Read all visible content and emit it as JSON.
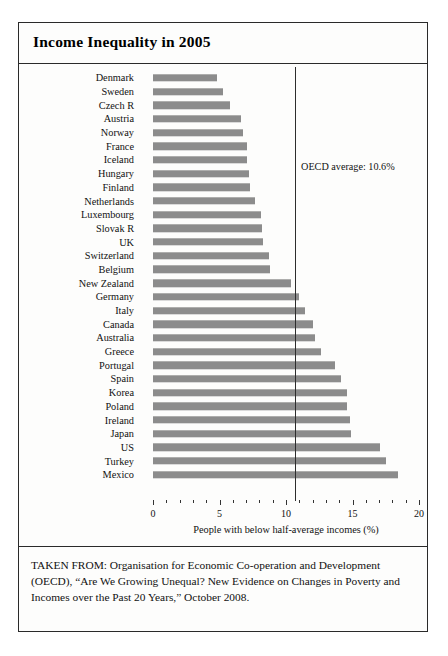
{
  "figure": {
    "title": "Income Inequality in 2005",
    "source_note": "TAKEN FROM: Organisation for Economic Co-operation and Development (OECD), “Are We Growing Unequal? New Evidence on Changes in Poverty and Incomes over the Past 20 Years,” October 2008."
  },
  "annotation": {
    "oecd_average_label": "OECD average: 10.6%",
    "oecd_average_value": 10.6
  },
  "chart_data": {
    "type": "bar",
    "orientation": "horizontal",
    "title": "Income Inequality in 2005",
    "xlabel": "People with below half-average incomes (%)",
    "ylabel": "",
    "xlim": [
      0,
      20
    ],
    "xticks": [
      0,
      5,
      10,
      15,
      20
    ],
    "xtick_labels": [
      "0",
      "5",
      "10",
      "15",
      "20"
    ],
    "minor_tick_step": 1,
    "grid": false,
    "legend": false,
    "bar_color": "#8c8c8c",
    "categories": [
      "Denmark",
      "Sweden",
      "Czech R",
      "Austria",
      "Norway",
      "France",
      "Iceland",
      "Hungary",
      "Finland",
      "Netherlands",
      "Luxembourg",
      "Slovak R",
      "UK",
      "Switzerland",
      "Belgium",
      "New Zealand",
      "Germany",
      "Italy",
      "Canada",
      "Australia",
      "Greece",
      "Portugal",
      "Spain",
      "Korea",
      "Poland",
      "Ireland",
      "Japan",
      "US",
      "Turkey",
      "Mexico"
    ],
    "values": [
      4.8,
      5.3,
      5.8,
      6.6,
      6.8,
      7.1,
      7.1,
      7.2,
      7.3,
      7.7,
      8.1,
      8.2,
      8.3,
      8.7,
      8.8,
      10.4,
      11.0,
      11.4,
      12.0,
      12.2,
      12.6,
      13.7,
      14.1,
      14.6,
      14.6,
      14.8,
      14.9,
      17.1,
      17.5,
      18.4
    ]
  }
}
